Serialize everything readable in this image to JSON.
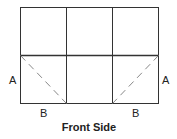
{
  "diagram": {
    "caption": "Front Side",
    "labels": {
      "left_a": "A",
      "right_a": "A",
      "left_b": "B",
      "right_b": "B"
    },
    "grid": {
      "columns": 3,
      "rows": 2
    },
    "colors": {
      "line": "#333333",
      "dashed": "#888888"
    }
  }
}
